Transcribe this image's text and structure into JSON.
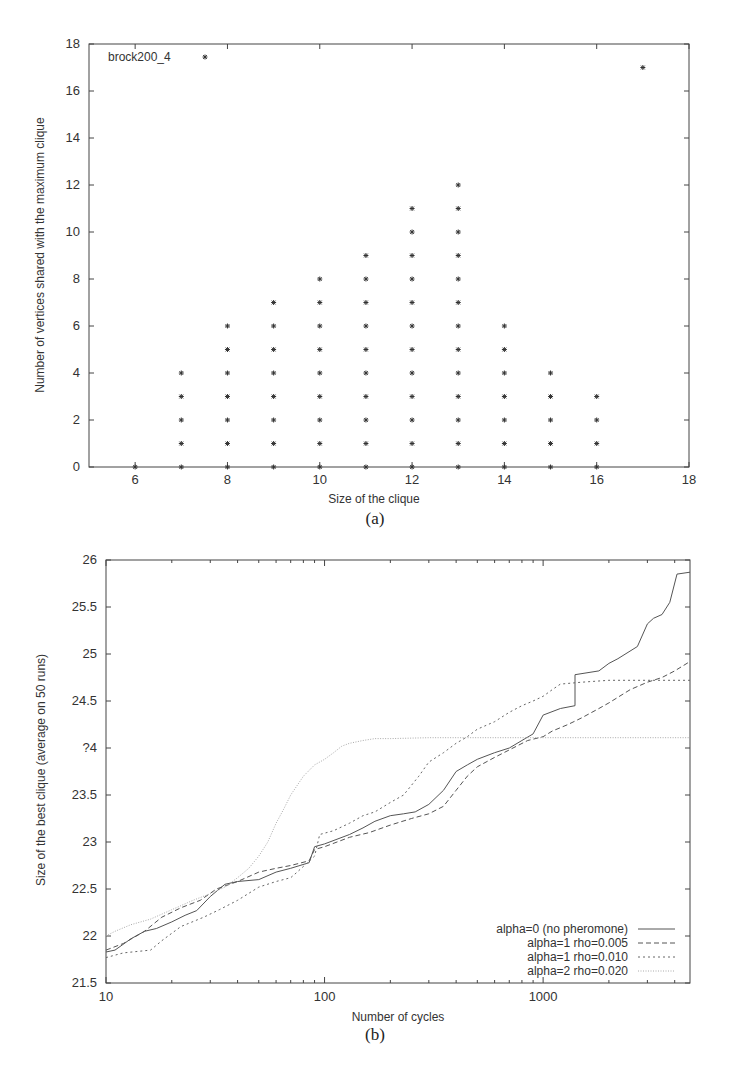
{
  "figure": {
    "panel_a_caption": "(a)",
    "panel_b_caption": "(b)"
  },
  "chart_data": [
    {
      "id": "a",
      "type": "scatter",
      "title": "",
      "legend": [
        {
          "label": "brock200_4",
          "marker": "asterisk"
        }
      ],
      "legend_position": "top-left",
      "xlabel": "Size of the clique",
      "ylabel": "Number of vertices shared with the maximum clique",
      "xlim": [
        5,
        18
      ],
      "ylim": [
        0,
        18
      ],
      "xticks": [
        6,
        8,
        10,
        12,
        14,
        16,
        18
      ],
      "yticks": [
        0,
        2,
        4,
        6,
        8,
        10,
        12,
        14,
        16,
        18
      ],
      "grid": false,
      "columns": [
        {
          "x": 6,
          "y_max": 0
        },
        {
          "x": 7,
          "y_max": 4
        },
        {
          "x": 8,
          "y_max": 6
        },
        {
          "x": 9,
          "y_max": 7
        },
        {
          "x": 10,
          "y_max": 8
        },
        {
          "x": 11,
          "y_max": 9
        },
        {
          "x": 12,
          "y_max": 11
        },
        {
          "x": 13,
          "y_max": 12
        },
        {
          "x": 14,
          "y_max": 6
        },
        {
          "x": 15,
          "y_max": 4
        },
        {
          "x": 16,
          "y_max": 3
        }
      ],
      "extra_points": [
        {
          "x": 17,
          "y": 17
        }
      ],
      "note": "Each column contains points at every integer y from 0 to y_max."
    },
    {
      "id": "b",
      "type": "line",
      "title": "",
      "xlabel": "Number of cycles",
      "ylabel": "Size of the best clique (average on 50 runs)",
      "xscale": "log",
      "xlim": [
        10,
        4700
      ],
      "ylim": [
        21.5,
        26
      ],
      "xticks": [
        10,
        100,
        1000
      ],
      "yticks": [
        21.5,
        22,
        22.5,
        23,
        23.5,
        24,
        24.5,
        25,
        25.5,
        26
      ],
      "ytick_labels": [
        "21.5",
        "22",
        "22.5",
        "23",
        "23.5",
        "?4",
        "24.5",
        "25",
        "25.5",
        "26"
      ],
      "grid": false,
      "legend_position": "bottom-right",
      "series": [
        {
          "name": "alpha=0 (no pheromone)",
          "style": "solid",
          "color": "#555555",
          "x": [
            10,
            11,
            13,
            15,
            17,
            20,
            23,
            26,
            30,
            35,
            40,
            50,
            60,
            70,
            85,
            90,
            100,
            130,
            150,
            170,
            200,
            230,
            260,
            300,
            350,
            400,
            450,
            500,
            600,
            700,
            800,
            900,
            1000,
            1200,
            1400,
            1400,
            1800,
            2000,
            2200,
            2700,
            3000,
            3200,
            3500,
            3800,
            4100,
            4700
          ],
          "y": [
            21.83,
            21.85,
            21.97,
            22.05,
            22.08,
            22.15,
            22.22,
            22.27,
            22.42,
            22.55,
            22.58,
            22.6,
            22.68,
            22.72,
            22.78,
            22.95,
            22.98,
            23.08,
            23.15,
            23.22,
            23.28,
            23.3,
            23.32,
            23.4,
            23.55,
            23.75,
            23.82,
            23.88,
            23.95,
            24.0,
            24.08,
            24.15,
            24.35,
            24.42,
            24.45,
            24.78,
            24.82,
            24.9,
            24.95,
            25.08,
            25.32,
            25.38,
            25.42,
            25.55,
            25.85,
            25.87
          ]
        },
        {
          "name": "alpha=1 rho=0.005",
          "style": "dashed",
          "color": "#555555",
          "x": [
            10,
            12,
            15,
            18,
            22,
            27,
            32,
            40,
            50,
            60,
            70,
            85,
            90,
            100,
            130,
            160,
            200,
            250,
            300,
            350,
            400,
            450,
            500,
            600,
            700,
            850,
            1000,
            1100,
            1300,
            1500,
            1800,
            2000,
            2500,
            3000,
            3500,
            4000,
            4700
          ],
          "y": [
            21.85,
            21.92,
            22.05,
            22.2,
            22.3,
            22.38,
            22.5,
            22.58,
            22.68,
            22.72,
            22.75,
            22.8,
            22.92,
            22.95,
            23.05,
            23.1,
            23.18,
            23.25,
            23.3,
            23.38,
            23.55,
            23.7,
            23.8,
            23.9,
            23.98,
            24.08,
            24.12,
            24.18,
            24.25,
            24.32,
            24.42,
            24.48,
            24.62,
            24.7,
            24.75,
            24.82,
            24.92
          ]
        },
        {
          "name": "alpha=1 rho=0.010",
          "style": "dotted-coarse",
          "color": "#666666",
          "x": [
            10,
            12,
            16,
            18,
            22,
            28,
            33,
            40,
            50,
            60,
            70,
            75,
            90,
            95,
            110,
            130,
            150,
            170,
            200,
            230,
            270,
            300,
            350,
            400,
            450,
            500,
            600,
            700,
            800,
            900,
            1000,
            1100,
            1200,
            1500,
            2000,
            3000,
            4700
          ],
          "y": [
            21.77,
            21.82,
            21.85,
            21.95,
            22.1,
            22.2,
            22.28,
            22.38,
            22.52,
            22.58,
            22.62,
            22.68,
            22.85,
            23.08,
            23.12,
            23.2,
            23.28,
            23.32,
            23.42,
            23.5,
            23.7,
            23.85,
            23.95,
            24.05,
            24.12,
            24.2,
            24.28,
            24.38,
            24.45,
            24.5,
            24.55,
            24.62,
            24.68,
            24.7,
            24.72,
            24.72,
            24.72
          ]
        },
        {
          "name": "alpha=2 rho=0.020",
          "style": "dotted-fine",
          "color": "#aaaaaa",
          "x": [
            10,
            11,
            13,
            16,
            20,
            25,
            30,
            35,
            40,
            45,
            50,
            55,
            60,
            65,
            70,
            80,
            90,
            100,
            110,
            120,
            130,
            150,
            170,
            200,
            300,
            500,
            1000,
            4700
          ],
          "y": [
            22.0,
            22.05,
            22.12,
            22.18,
            22.28,
            22.38,
            22.45,
            22.52,
            22.62,
            22.72,
            22.85,
            23.0,
            23.2,
            23.35,
            23.5,
            23.7,
            23.82,
            23.88,
            23.95,
            24.02,
            24.05,
            24.08,
            24.1,
            24.1,
            24.11,
            24.11,
            24.11,
            24.11
          ]
        }
      ]
    }
  ]
}
